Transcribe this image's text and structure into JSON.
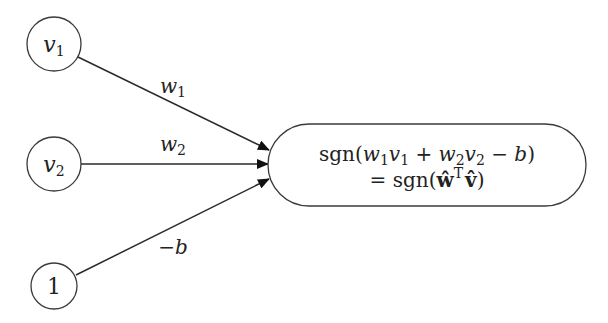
{
  "diagram": {
    "type": "perceptron",
    "inputs": [
      {
        "id": "v1",
        "base": "v",
        "sub": "1",
        "cx": 54,
        "cy": 44,
        "r": 27
      },
      {
        "id": "v2",
        "base": "v",
        "sub": "2",
        "cx": 54,
        "cy": 164,
        "r": 27
      },
      {
        "id": "bias",
        "label": "1",
        "cx": 54,
        "cy": 286,
        "r": 23
      }
    ],
    "edges": [
      {
        "from": "v1",
        "to": "output",
        "weight_base": "w",
        "weight_sub": "1"
      },
      {
        "from": "v2",
        "to": "output",
        "weight_base": "w",
        "weight_sub": "2"
      },
      {
        "from": "bias",
        "to": "output",
        "weight_label": "−b"
      }
    ],
    "output": {
      "line1": {
        "prefix": "sgn(",
        "w1": "w",
        "w1_sub": "1",
        "v1": "v",
        "v1_sub": "1",
        "plus": " + ",
        "w2": "w",
        "w2_sub": "2",
        "v2": "v",
        "v2_sub": "2",
        "minus": " − ",
        "b": "b",
        "suffix": ")"
      },
      "line2": {
        "prefix": "= sgn(",
        "w_hat": "ŵ",
        "transpose": "T",
        "v_hat": "v̂",
        "suffix": ")"
      }
    },
    "colors": {
      "stroke": "#3a3a3a",
      "arrow": "#111111",
      "text": "#222222",
      "background": "#ffffff"
    }
  }
}
